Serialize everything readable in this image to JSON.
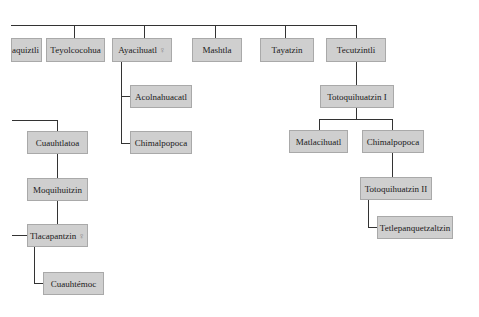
{
  "diagram": {
    "type": "family-tree",
    "colors": {
      "box_fill": "#cfcfcf",
      "box_border": "#a9a9a9",
      "line": "#333333",
      "background": "#ffffff"
    },
    "top_row": [
      {
        "label": "aquiztli",
        "female": false
      },
      {
        "label": "Teyolcocohua",
        "female": false
      },
      {
        "label": "Ayacihuatl",
        "female": true
      },
      {
        "label": "Mashtla",
        "female": false
      },
      {
        "label": "Tayatzin",
        "female": false
      },
      {
        "label": "Tecutzintli",
        "female": false
      }
    ],
    "ayacihuatl_children": [
      {
        "label": "Acolnahuacatl"
      },
      {
        "label": "Chimalpopoca"
      }
    ],
    "tecutzintli_line": {
      "child": "Totoquihuatzin I",
      "grandchildren": [
        {
          "label": "Matlacihuatl"
        },
        {
          "label": "Chimalpopoca"
        }
      ],
      "great_grandchild": "Totoquihuatzin II",
      "great_great_grandchild": "Tetlepanquetzaltzin"
    },
    "left_line": {
      "first": "Cuauhtlatoa",
      "second": "Moquihuitzin",
      "third": {
        "label": "Tlacapantzin",
        "female": true
      },
      "fourth": "Cuauhtémoc"
    },
    "female_symbol": "♀"
  }
}
